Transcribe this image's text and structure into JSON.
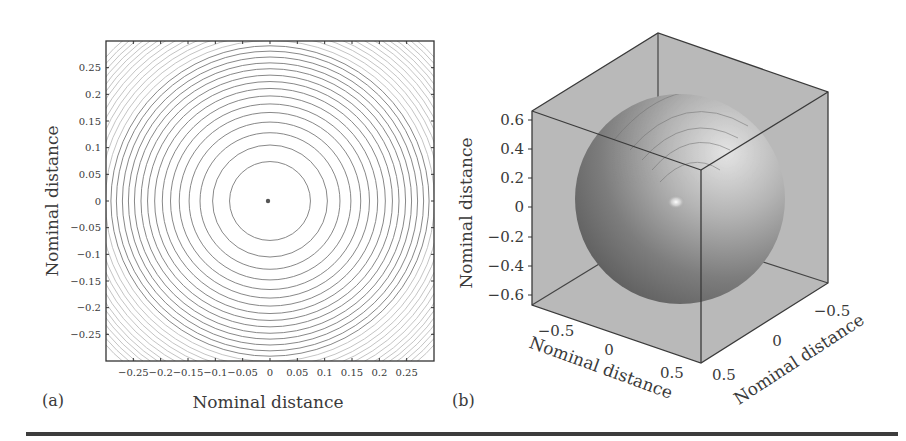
{
  "figure": {
    "panel_a": {
      "label": "(a)",
      "xlabel": "Nominal distance",
      "ylabel": "Nominal distance"
    },
    "panel_b": {
      "label": "(b)",
      "xlabel": "Nominal distance",
      "ylabel": "Nominal distance",
      "zlabel": "Nominal distance"
    }
  },
  "chart_data": [
    {
      "type": "contour",
      "panel": "(a)",
      "title": "",
      "xlabel": "Nominal distance",
      "ylabel": "Nominal distance",
      "xlim": [
        -0.3,
        0.3
      ],
      "ylim": [
        -0.3,
        0.3
      ],
      "x_ticks": [
        "-0.25",
        "-0.2",
        "-0.15",
        "-0.1",
        "-0.05",
        "0",
        "0.05",
        "0.1",
        "0.15",
        "0.2",
        "0.25"
      ],
      "y_ticks": [
        "0.25",
        "0.2",
        "0.15",
        "0.1",
        "0.05",
        "0",
        "-0.05",
        "-0.1",
        "-0.15",
        "-0.2",
        "-0.25"
      ],
      "center": [
        0,
        0
      ],
      "contour_radii": [
        0.074,
        0.105,
        0.128,
        0.148,
        0.166,
        0.182,
        0.197,
        0.211,
        0.224,
        0.236,
        0.248,
        0.259,
        0.27,
        0.281,
        0.291,
        0.301,
        0.311,
        0.32,
        0.329,
        0.338,
        0.347,
        0.356,
        0.364,
        0.372,
        0.38,
        0.388,
        0.396,
        0.404
      ],
      "grid": false,
      "legend": null
    },
    {
      "type": "surface3d",
      "panel": "(b)",
      "title": "",
      "xlabel": "Nominal distance",
      "ylabel": "Nominal distance",
      "zlabel": "Nominal distance",
      "xlim": [
        -0.6,
        0.6
      ],
      "ylim": [
        -0.6,
        0.6
      ],
      "zlim": [
        -0.65,
        0.65
      ],
      "x_ticks": [
        "-0.5",
        "0",
        "0.5"
      ],
      "y_ticks": [
        "-0.5",
        "0",
        "0.5"
      ],
      "z_ticks": [
        "0.6",
        "0.4",
        "0.2",
        "0",
        "-0.2",
        "-0.4",
        "-0.6"
      ],
      "shape": "sphere",
      "sphere_radius": 0.6,
      "grid": false,
      "legend": null
    }
  ]
}
